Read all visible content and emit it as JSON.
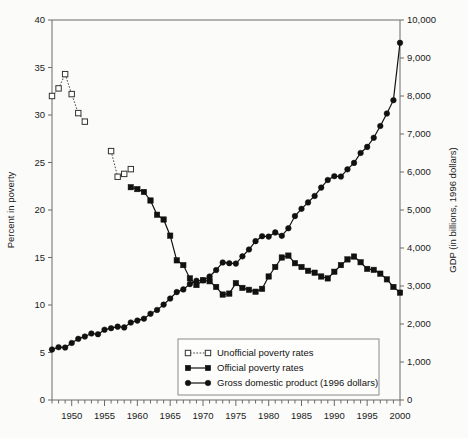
{
  "chart_data": {
    "type": "line",
    "title": "",
    "xlabel": "",
    "ylabel": "Percent in poverty",
    "y2label": "GDP (in billions, 1996 dollars)",
    "grid": false,
    "legend_position": "bottom-center",
    "xlim": [
      1947,
      2000
    ],
    "ylim": [
      0,
      40
    ],
    "y2lim": [
      0,
      10000
    ],
    "xticks": [
      1950,
      1955,
      1960,
      1965,
      1970,
      1975,
      1980,
      1985,
      1990,
      1995,
      2000
    ],
    "xtick_labels": [
      "1950",
      "1955",
      "1960",
      "1965",
      "1970",
      "1975",
      "1980",
      "1985",
      "1990",
      "1995",
      "2000"
    ],
    "xminor_step": 1,
    "yticks": [
      0,
      5,
      10,
      15,
      20,
      25,
      30,
      35,
      40
    ],
    "ytick_labels": [
      "0",
      "5",
      "10",
      "15",
      "20",
      "25",
      "30",
      "35",
      "40"
    ],
    "y2ticks": [
      0,
      1000,
      2000,
      3000,
      4000,
      5000,
      6000,
      7000,
      8000,
      9000,
      10000
    ],
    "y2tick_labels": [
      "0",
      "1,000",
      "2,000",
      "3,000",
      "4,000",
      "5,000",
      "6,000",
      "7,000",
      "8,000",
      "9,000",
      "10,000"
    ],
    "series": [
      {
        "name": "Unofficial poverty rates",
        "axis": "left",
        "marker": "open-square",
        "line": "dotted",
        "color": "#333333",
        "segments": [
          {
            "x": [
              1947,
              1948,
              1949,
              1950,
              1951,
              1952
            ],
            "y": [
              32.0,
              32.8,
              34.3,
              32.2,
              30.2,
              29.3
            ]
          },
          {
            "x": [
              1956,
              1957,
              1958,
              1959
            ],
            "y": [
              26.2,
              23.5,
              23.8,
              24.3
            ]
          }
        ]
      },
      {
        "name": "Official poverty rates",
        "axis": "left",
        "marker": "filled-square",
        "line": "solid",
        "color": "#111111",
        "x": [
          1959,
          1960,
          1961,
          1962,
          1963,
          1964,
          1965,
          1966,
          1967,
          1968,
          1969,
          1970,
          1971,
          1972,
          1973,
          1974,
          1975,
          1976,
          1977,
          1978,
          1979,
          1980,
          1981,
          1982,
          1983,
          1984,
          1985,
          1986,
          1987,
          1988,
          1989,
          1990,
          1991,
          1992,
          1993,
          1994,
          1995,
          1996,
          1997,
          1998,
          1999,
          2000
        ],
        "y": [
          22.4,
          22.2,
          21.9,
          21.0,
          19.5,
          19.0,
          17.3,
          14.7,
          14.2,
          12.8,
          12.1,
          12.6,
          12.5,
          11.9,
          11.1,
          11.2,
          12.3,
          11.8,
          11.6,
          11.4,
          11.7,
          13.0,
          14.0,
          15.0,
          15.2,
          14.4,
          14.0,
          13.6,
          13.4,
          13.0,
          12.8,
          13.5,
          14.2,
          14.8,
          15.1,
          14.5,
          13.8,
          13.7,
          13.3,
          12.7,
          11.9,
          11.3
        ]
      },
      {
        "name": "Gross domestic product (1996 dollars)",
        "axis": "right",
        "marker": "filled-circle",
        "line": "solid",
        "color": "#111111",
        "x": [
          1947,
          1948,
          1949,
          1950,
          1951,
          1952,
          1953,
          1954,
          1955,
          1956,
          1957,
          1958,
          1959,
          1960,
          1961,
          1962,
          1963,
          1964,
          1965,
          1966,
          1967,
          1968,
          1969,
          1970,
          1971,
          1972,
          1973,
          1974,
          1975,
          1976,
          1977,
          1978,
          1979,
          1980,
          1981,
          1982,
          1983,
          1984,
          1985,
          1986,
          1987,
          1988,
          1989,
          1990,
          1991,
          1992,
          1993,
          1994,
          1995,
          1996,
          1997,
          1998,
          1999,
          2000
        ],
        "y": [
          1330,
          1390,
          1380,
          1500,
          1610,
          1670,
          1750,
          1730,
          1850,
          1890,
          1930,
          1910,
          2040,
          2090,
          2140,
          2270,
          2370,
          2510,
          2670,
          2840,
          2910,
          3050,
          3140,
          3150,
          3250,
          3420,
          3620,
          3600,
          3590,
          3780,
          3960,
          4180,
          4310,
          4300,
          4410,
          4320,
          4520,
          4840,
          5030,
          5200,
          5370,
          5590,
          5790,
          5890,
          5880,
          6070,
          6240,
          6500,
          6660,
          6900,
          7210,
          7540,
          7890,
          9400
        ],
        "note": "final 2000 point at ~9,400"
      }
    ]
  },
  "legend": {
    "items": [
      {
        "label": "Unofficial poverty rates",
        "marker": "open-square",
        "line": "dotted"
      },
      {
        "label": "Official poverty rates",
        "marker": "filled-square",
        "line": "solid"
      },
      {
        "label": "Gross domestic product (1996 dollars)",
        "marker": "filled-circle",
        "line": "solid"
      }
    ]
  }
}
